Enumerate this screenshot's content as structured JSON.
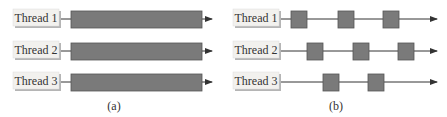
{
  "colors": {
    "bar_fill": "#7a7a7a",
    "bar_stroke": "#555555",
    "line": "#333333",
    "label_fill": "#f2f1ee",
    "label_shadow": "#b5b5b5"
  },
  "panels": [
    {
      "id": "a",
      "caption": "(a)",
      "description": "Multiple threads running on multiple CPUs",
      "threads": [
        {
          "label": "Thread 1",
          "segments": [
            [
              71,
              202
            ]
          ]
        },
        {
          "label": "Thread 2",
          "segments": [
            [
              71,
              202
            ]
          ]
        },
        {
          "label": "Thread 3",
          "segments": [
            [
              71,
              202
            ]
          ]
        }
      ]
    },
    {
      "id": "b",
      "caption": "(b)",
      "description": "Multiple threads sharing a single CPU",
      "threads": [
        {
          "label": "Thread 1",
          "segments": [
            [
              291,
              306
            ],
            [
              338,
              354
            ],
            [
              383,
              399
            ]
          ]
        },
        {
          "label": "Thread 2",
          "segments": [
            [
              307,
              322
            ],
            [
              353,
              369
            ],
            [
              398,
              414
            ]
          ]
        },
        {
          "label": "Thread 3",
          "segments": [
            [
              323,
              339
            ],
            [
              368,
              384
            ]
          ]
        }
      ]
    }
  ]
}
